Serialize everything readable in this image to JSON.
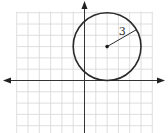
{
  "diagram": {
    "type": "coordinate-plane-circle",
    "grid": {
      "x_range": [
        -6,
        6
      ],
      "y_range": [
        -5,
        6
      ]
    },
    "axes": {
      "x_arrows": "both",
      "y_arrows": "up"
    },
    "circle": {
      "center": [
        2,
        3
      ],
      "radius": 3,
      "radius_label": "3",
      "radius_direction_deg": 30
    },
    "colors": {
      "grid": "#d6d6d6",
      "axis": "#333333",
      "circle": "#2a2a2a"
    }
  }
}
